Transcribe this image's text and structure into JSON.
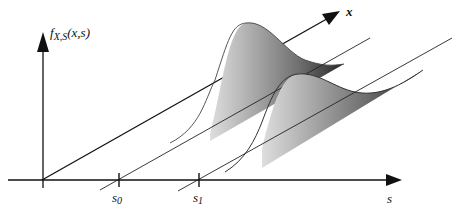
{
  "figure": {
    "y_axis_label": "f",
    "y_axis_label_sub": "X,S",
    "y_axis_label_args": "(x,s)",
    "x_axis_label": "x",
    "s_axis_label": "s",
    "ticks": [
      {
        "base": "s",
        "sub": "0"
      },
      {
        "base": "s",
        "sub": "1"
      }
    ]
  },
  "colors": {
    "axis": "#111111",
    "shade_light": "#f4f4f4",
    "shade_dark": "#2a2a2a"
  }
}
